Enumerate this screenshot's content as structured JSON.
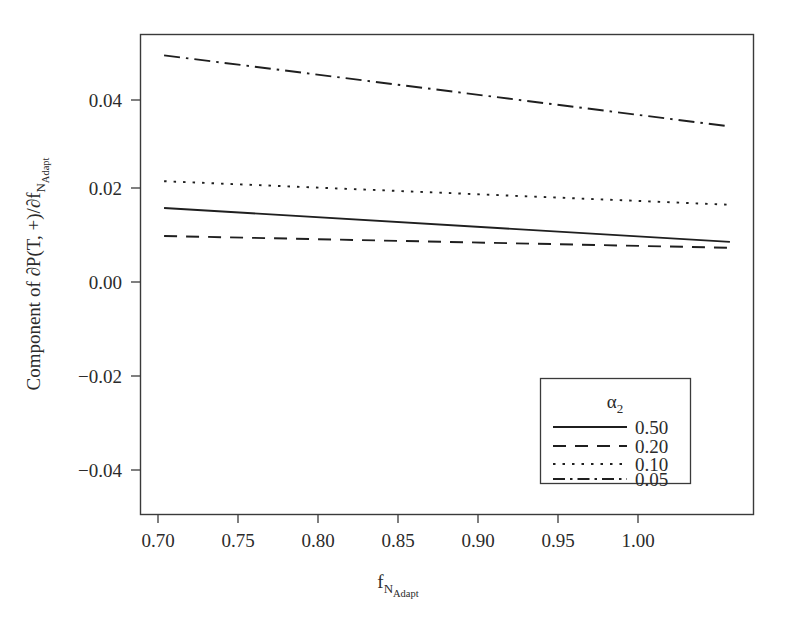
{
  "chart_data": {
    "type": "line",
    "title": "",
    "xlabel": "f_N_Adapt",
    "xlabel_parts": {
      "base": "f",
      "sub": "N",
      "subsub": "Adapt"
    },
    "ylabel": "Component of ∂P(T, +)/∂f_N_Adapt",
    "ylabel_parts": {
      "main": "Component of ∂P(T, +)/∂f",
      "sub": "N",
      "subsub": "Adapt"
    },
    "xlim": [
      0.6875,
      1.0125
    ],
    "ylim": [
      -0.0525,
      0.0535
    ],
    "xticks": [
      0.7,
      0.75,
      0.8,
      0.85,
      0.9,
      0.95,
      1.0
    ],
    "xticklabels": [
      "0.70",
      "0.75",
      "0.80",
      "0.85",
      "0.90",
      "0.95",
      "1.00"
    ],
    "yticks": [
      0.04,
      0.02,
      0.0,
      -0.02,
      -0.04
    ],
    "yticklabels": [
      "0.04",
      "0.02",
      "0.00",
      "−0.02",
      "−0.04"
    ],
    "grid": false,
    "x": [
      0.7,
      1.0
    ],
    "series": [
      {
        "name": "0.50",
        "dash": "solid",
        "values": [
          0.0152,
          0.0077
        ]
      },
      {
        "name": "0.20",
        "dash": "dashed",
        "values": [
          0.009,
          0.0064
        ]
      },
      {
        "name": "0.10",
        "dash": "dotted",
        "values": [
          0.0211,
          0.0159
        ]
      },
      {
        "name": "0.05",
        "dash": "dashdot",
        "values": [
          0.0489,
          0.0332
        ]
      }
    ],
    "legend": {
      "title": "α",
      "title_sub": "2",
      "position": "lower right",
      "entries": [
        "0.50",
        "0.20",
        "0.10",
        "0.05"
      ]
    },
    "colors": {
      "line": "#1f1f1f",
      "axis": "#3a3a3a",
      "background": "#ffffff"
    }
  }
}
